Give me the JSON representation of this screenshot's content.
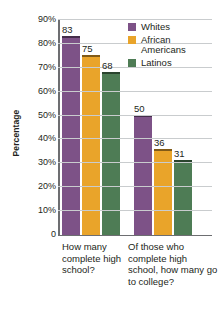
{
  "chart_data": {
    "type": "bar",
    "title": "",
    "xlabel": "",
    "ylabel": "Percentage",
    "ylim": [
      0,
      90
    ],
    "grid": true,
    "legend_position": "top-right",
    "ytick_labels": [
      "90%",
      "80%",
      "70%",
      "60%",
      "50%",
      "40%",
      "30%",
      "20%",
      "10%",
      "0"
    ],
    "ytick_values": [
      90,
      80,
      70,
      60,
      50,
      40,
      30,
      20,
      10,
      0
    ],
    "categories": [
      "How many complete high school?",
      "Of those who complete high school, how many go to college?"
    ],
    "series": [
      {
        "name": "Whites",
        "color": "#7d5287",
        "values": [
          83,
          50
        ]
      },
      {
        "name": "African Americans",
        "color": "#e9a42a",
        "values": [
          75,
          36
        ]
      },
      {
        "name": "Latinos",
        "color": "#4e7c55",
        "values": [
          68,
          31
        ]
      }
    ]
  },
  "legend": {
    "items": [
      {
        "label": "Whites"
      },
      {
        "label": "African Americans"
      },
      {
        "label": "Latinos"
      }
    ]
  },
  "axis": {
    "y_title": "Percentage"
  },
  "colors": {
    "gridline": "#c9ccce",
    "baseline": "#6d6e71",
    "text": "#231f20",
    "background": "#ffffff"
  }
}
